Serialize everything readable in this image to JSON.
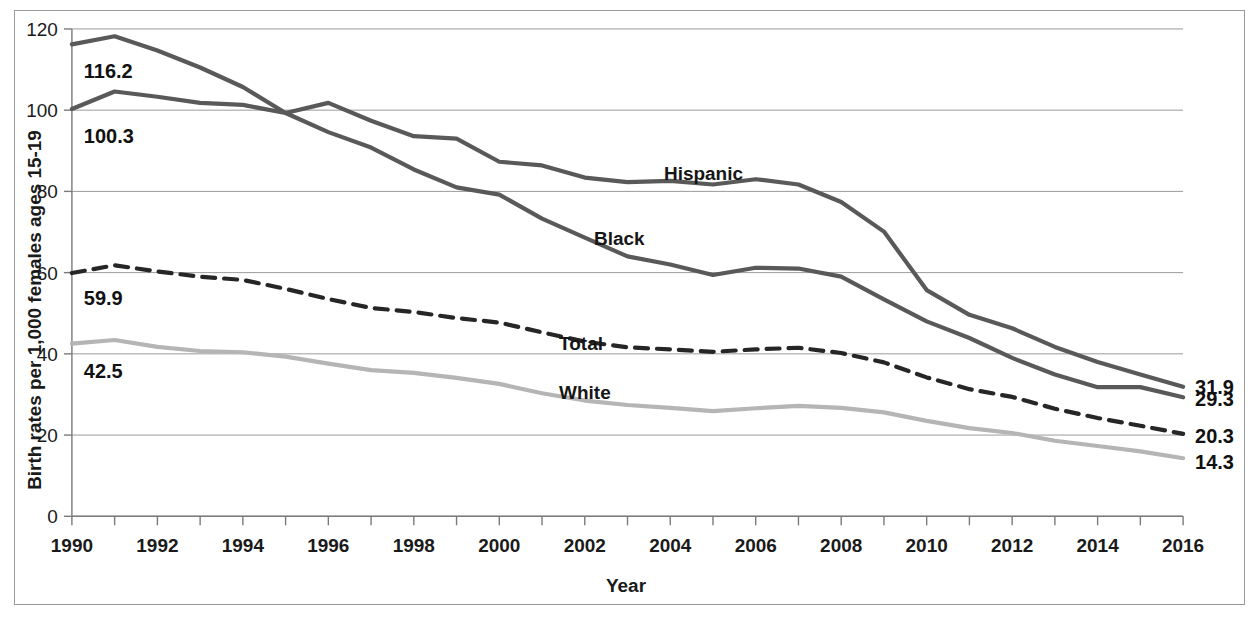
{
  "chart_data": {
    "type": "line",
    "title": "",
    "xlabel": "Year",
    "ylabel": "Birth rates per 1,000 females ages 15-19",
    "xlim": [
      1990,
      2016
    ],
    "ylim": [
      0,
      120
    ],
    "grid": true,
    "legend_position": "inline-annotations",
    "x": [
      1990,
      1991,
      1992,
      1993,
      1994,
      1995,
      1996,
      1997,
      1998,
      1999,
      2000,
      2001,
      2002,
      2003,
      2004,
      2005,
      2006,
      2007,
      2008,
      2009,
      2010,
      2011,
      2012,
      2013,
      2014,
      2015,
      2016
    ],
    "xtick_labels": [
      "1990",
      "1992",
      "1994",
      "1996",
      "1998",
      "2000",
      "2002",
      "2004",
      "2006",
      "2008",
      "2010",
      "2012",
      "2014",
      "2016"
    ],
    "ytick_labels": [
      "0",
      "20",
      "40",
      "60",
      "80",
      "100",
      "120"
    ],
    "ytick_values": [
      0,
      20,
      40,
      60,
      80,
      100,
      120
    ],
    "series": [
      {
        "name": "Black",
        "label": "Black",
        "color": "#595959",
        "style": "solid",
        "width": 4.2,
        "start_label": "116.2",
        "end_label": "29.3",
        "values": [
          116.2,
          118.2,
          114.7,
          110.5,
          105.7,
          99.3,
          94.6,
          90.8,
          85.4,
          81.0,
          79.2,
          73.3,
          68.6,
          64.0,
          62.0,
          59.4,
          61.2,
          61.0,
          59.0,
          53.4,
          48.0,
          43.9,
          39.0,
          34.9,
          31.8,
          31.8,
          29.3
        ]
      },
      {
        "name": "Hispanic",
        "label": "Hispanic",
        "color": "#595959",
        "style": "solid",
        "width": 4.2,
        "start_label": "100.3",
        "end_label": "31.9",
        "values": [
          100.3,
          104.6,
          103.3,
          101.8,
          101.3,
          99.3,
          101.8,
          97.4,
          93.6,
          93.0,
          87.3,
          86.4,
          83.4,
          82.3,
          82.6,
          81.7,
          83.0,
          81.7,
          77.4,
          70.1,
          55.7,
          49.6,
          46.3,
          41.7,
          38.0,
          34.9,
          31.9
        ]
      },
      {
        "name": "Total",
        "label": "Total",
        "color": "#262626",
        "style": "dashed",
        "width": 4.2,
        "start_label": "59.9",
        "end_label": "20.3",
        "values": [
          59.9,
          61.8,
          60.3,
          59.0,
          58.2,
          56.0,
          53.5,
          51.3,
          50.3,
          48.8,
          47.7,
          45.3,
          43.0,
          41.6,
          41.1,
          40.5,
          41.1,
          41.5,
          40.2,
          37.9,
          34.2,
          31.3,
          29.4,
          26.5,
          24.2,
          22.3,
          20.3
        ]
      },
      {
        "name": "White",
        "label": "White",
        "color": "#b5b5b5",
        "style": "solid",
        "width": 4.2,
        "start_label": "42.5",
        "end_label": "14.3",
        "values": [
          42.5,
          43.4,
          41.7,
          40.7,
          40.4,
          39.3,
          37.6,
          36.0,
          35.3,
          34.1,
          32.6,
          30.3,
          28.5,
          27.4,
          26.7,
          25.9,
          26.6,
          27.2,
          26.7,
          25.6,
          23.5,
          21.7,
          20.5,
          18.6,
          17.3,
          16.0,
          14.3
        ]
      }
    ]
  }
}
